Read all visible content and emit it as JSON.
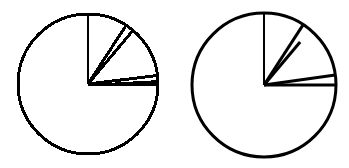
{
  "chart_data": [
    {
      "type": "pie",
      "style": "pixelated",
      "title": "",
      "center": [
        88,
        84
      ],
      "radius": 70,
      "stroke_width": 3,
      "color": "#000000",
      "fill": "#ffffff",
      "spoke_angles_deg": [
        90,
        57,
        50,
        7,
        0
      ],
      "wedges": [
        {
          "from": 57,
          "to": 90,
          "label": ""
        },
        {
          "from": 50,
          "to": 57,
          "label": ""
        },
        {
          "from": 7,
          "to": 50,
          "label": ""
        },
        {
          "from": 0,
          "to": 7,
          "label": ""
        },
        {
          "from": -270,
          "to": 0,
          "label": ""
        }
      ],
      "approx_shares_pct": [
        9.2,
        1.9,
        11.9,
        1.9,
        75.0
      ]
    },
    {
      "type": "pie",
      "style": "smooth",
      "title": "",
      "center": [
        264,
        85
      ],
      "radius": 72,
      "stroke_width": 3,
      "color": "#000000",
      "fill": "#ffffff",
      "spoke_angles_deg": [
        90,
        57,
        50,
        8,
        0
      ],
      "short_spokes": [
        50
      ],
      "wedges": [
        {
          "from": 57,
          "to": 90,
          "label": ""
        },
        {
          "from": 50,
          "to": 57,
          "label": ""
        },
        {
          "from": 8,
          "to": 50,
          "label": ""
        },
        {
          "from": 0,
          "to": 8,
          "label": ""
        },
        {
          "from": -270,
          "to": 0,
          "label": ""
        }
      ],
      "approx_shares_pct": [
        9.2,
        1.9,
        11.7,
        2.2,
        75.0
      ]
    }
  ]
}
